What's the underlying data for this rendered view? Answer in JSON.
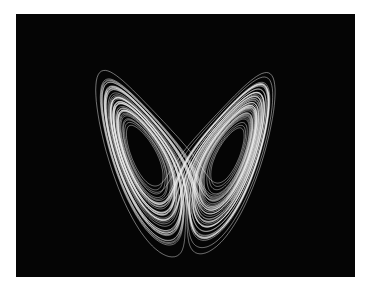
{
  "image": {
    "subject": "lorenz-attractor",
    "background_color": "#ffffff",
    "panel_color": "#050505",
    "trajectory_color": "#f2f2f2",
    "frame": {
      "x": 16,
      "y": 14,
      "width": 339,
      "height": 263
    }
  },
  "attractor": {
    "sigma": 10,
    "rho": 28,
    "beta": 2.6666667,
    "dt": 0.005,
    "steps": 16000,
    "start": [
      1.0,
      1.0,
      20.0
    ],
    "projection": {
      "center_x": 170,
      "z_ref": 27,
      "y_at_z_ref": 141,
      "scale_x": 5.0,
      "mix_y": 0.18,
      "scale_z": 4.75
    },
    "fixed_point_eyes": [
      {
        "name": "left-eye",
        "cx": 127,
        "cy": 142
      },
      {
        "name": "right-eye",
        "cx": 213,
        "cy": 139
      }
    ]
  }
}
